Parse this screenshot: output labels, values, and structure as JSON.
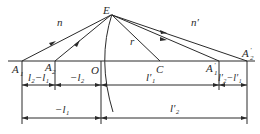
{
  "diagram": {
    "type": "refraction-at-spherical-surface",
    "points": {
      "E": "E",
      "O": "O",
      "C": "C",
      "A1": {
        "base": "A",
        "sub": "1",
        "prime": ""
      },
      "A2": {
        "base": "A",
        "sub": "2",
        "prime": ""
      },
      "A1p": {
        "base": "A",
        "sub": "1",
        "prime": "′"
      },
      "A2p": {
        "base": "A",
        "sub": "2",
        "prime": "′"
      }
    },
    "media": {
      "left": "n",
      "right": "n′"
    },
    "radius_label": "r",
    "dimensions": {
      "row1": [
        {
          "text": "l₂−l₁"
        },
        {
          "text": "−l₂"
        },
        {
          "text": "l′₁"
        },
        {
          "text": "l′₂−l′₁"
        }
      ],
      "row2": [
        {
          "text": "−l₁"
        },
        {
          "text": "l′₂"
        }
      ]
    }
  }
}
